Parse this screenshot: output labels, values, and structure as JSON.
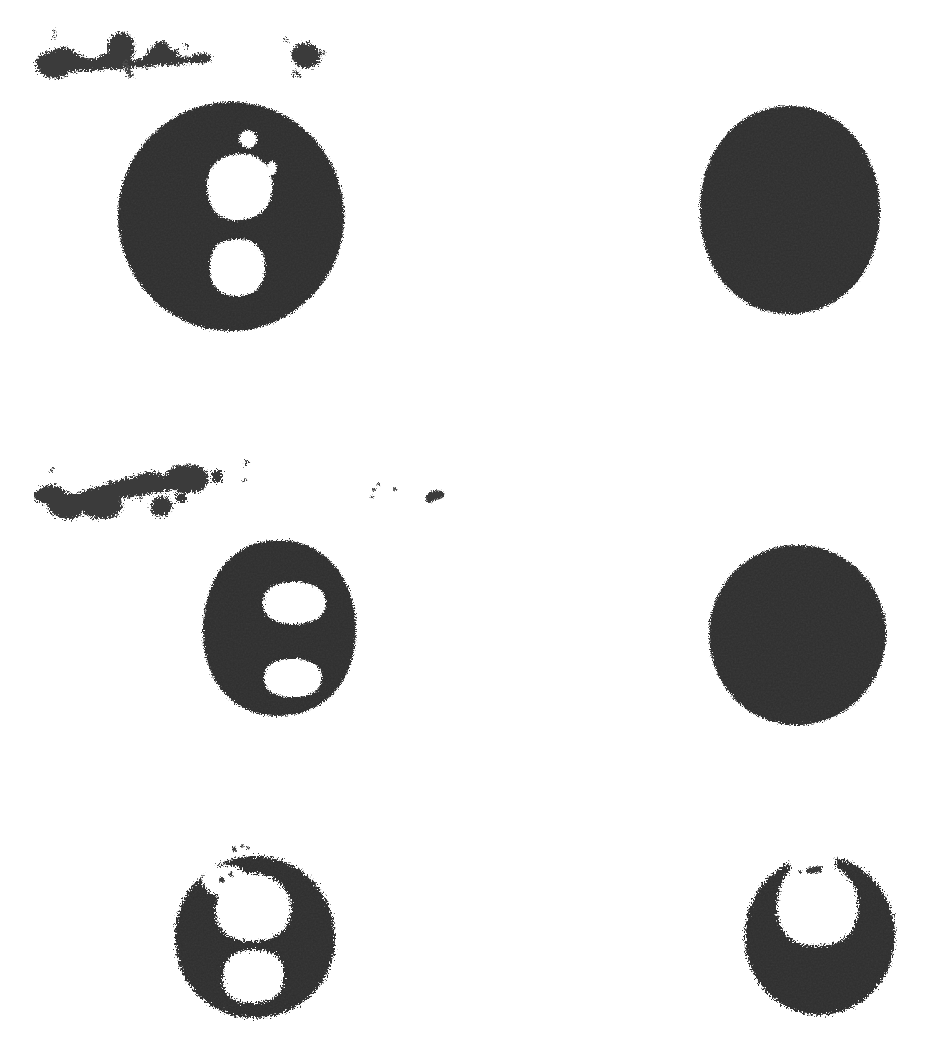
{
  "page": {
    "kind": "scanned-binary-figure",
    "width": 943,
    "height": 1040,
    "background_color": "#ffffff",
    "ink_color": "#2f2f2f",
    "description": "Thresholded black-and-white scan showing six dark circular blobs in a two-column, three-row arrangement with scattered ink smudges above the first and second rows."
  },
  "palette": {
    "ink": "#2f2f2f",
    "ink_dark": "#232323",
    "ink_light": "#3a3a3a",
    "paper": "#ffffff",
    "smudge": "#3b3b3b"
  },
  "figure": {
    "rows": 3,
    "columns": 2,
    "blob_count": 6,
    "smudge_group_count": 2
  },
  "blobs": [
    {
      "id": "blob-r1c1",
      "label": "top-left-disc",
      "cx": 231,
      "cy": 216,
      "rx": 113,
      "ry": 114,
      "fill": "#2f2f2f",
      "holes": [
        {
          "id": "hole-r1c1-upper",
          "cx": 239,
          "cy": 187,
          "rx": 32,
          "ry": 33
        },
        {
          "id": "hole-r1c1-lower",
          "cx": 237,
          "cy": 267,
          "rx": 28,
          "ry": 29
        },
        {
          "id": "hole-r1c1-fleck-a",
          "cx": 248,
          "cy": 139,
          "rx": 9,
          "ry": 9
        },
        {
          "id": "hole-r1c1-fleck-b",
          "cx": 272,
          "cy": 168,
          "rx": 5,
          "ry": 7
        }
      ]
    },
    {
      "id": "blob-r1c2",
      "label": "top-right-disc",
      "cx": 790,
      "cy": 210,
      "rx": 90,
      "ry": 104,
      "fill": "#2f2f2f",
      "holes": []
    },
    {
      "id": "blob-r2c1",
      "label": "middle-left-disc",
      "cx": 279,
      "cy": 628,
      "rx": 77,
      "ry": 88,
      "fill": "#2f2f2f",
      "holes": [
        {
          "id": "hole-r2c1-upper",
          "cx": 294,
          "cy": 603,
          "rx": 31,
          "ry": 21
        },
        {
          "id": "hole-r2c1-lower",
          "cx": 293,
          "cy": 678,
          "rx": 29,
          "ry": 19
        }
      ]
    },
    {
      "id": "blob-r2c2",
      "label": "middle-right-disc",
      "cx": 797,
      "cy": 635,
      "rx": 88,
      "ry": 90,
      "fill": "#2f2f2f",
      "holes": []
    },
    {
      "id": "blob-r3c1",
      "label": "bottom-left-disc",
      "cx": 255,
      "cy": 937,
      "rx": 80,
      "ry": 82,
      "fill": "#2f2f2f",
      "holes": [
        {
          "id": "hole-r3c1-upper",
          "cx": 255,
          "cy": 907,
          "rx": 37,
          "ry": 33
        },
        {
          "id": "hole-r3c1-lower",
          "cx": 253,
          "cy": 975,
          "rx": 30,
          "ry": 27
        }
      ]
    },
    {
      "id": "blob-r3c2",
      "label": "bottom-right-disc",
      "cx": 820,
      "cy": 935,
      "rx": 75,
      "ry": 80,
      "fill": "#2f2f2f",
      "holes": [
        {
          "id": "hole-r3c2-notch",
          "cx": 818,
          "cy": 897,
          "rx": 40,
          "ry": 40
        }
      ]
    }
  ],
  "smudges": [
    {
      "id": "smudge-row1-left",
      "label": "upper-left-ink-streak",
      "bbox": [
        32,
        30,
        190,
        40
      ]
    },
    {
      "id": "smudge-row1-right",
      "label": "upper-right-ink-speck",
      "bbox": [
        283,
        38,
        45,
        28
      ]
    },
    {
      "id": "smudge-row2-left",
      "label": "middle-left-ink-streak",
      "bbox": [
        28,
        460,
        225,
        48
      ]
    },
    {
      "id": "smudge-row2-right",
      "label": "middle-right-ink-speck",
      "bbox": [
        370,
        480,
        75,
        22
      ]
    }
  ]
}
